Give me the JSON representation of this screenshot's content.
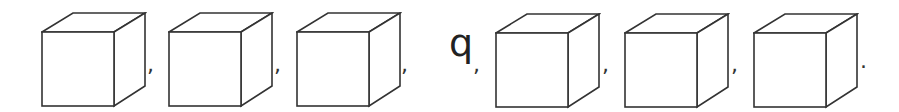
{
  "sequence": [
    {
      "type": "cube",
      "x": 41,
      "sep": ","
    },
    {
      "type": "cube",
      "x": 168,
      "sep": ","
    },
    {
      "type": "cube",
      "x": 296,
      "sep": ","
    },
    {
      "type": "letter",
      "value": "q",
      "sep": ","
    },
    {
      "type": "cube",
      "x": 495,
      "sep": ","
    },
    {
      "type": "cube",
      "x": 624,
      "sep": ","
    },
    {
      "type": "cube",
      "x": 753,
      "sep": "."
    }
  ],
  "letter": "q",
  "separators": {
    "comma": ",",
    "period": "."
  },
  "colors": {
    "stroke": "#333333",
    "background": "#ffffff"
  }
}
